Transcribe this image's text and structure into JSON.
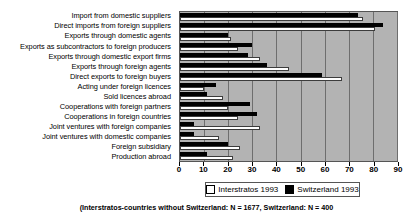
{
  "chart_data": {
    "type": "bar",
    "orientation": "horizontal",
    "title": "",
    "subtitle": "",
    "xlabel": "",
    "ylabel": "",
    "xlim": [
      0,
      90
    ],
    "xticks": [
      0,
      10,
      20,
      30,
      40,
      50,
      60,
      70,
      80,
      90
    ],
    "xtick_labels": [
      "0",
      "10",
      "20",
      "30",
      "40",
      "50",
      "60",
      "70",
      "80",
      "90"
    ],
    "grid": true,
    "grid_axis": "x",
    "legend_position": "bottom",
    "plot_background": "#b3b3b3",
    "categories": [
      "Import from domestic suppliers",
      "Direct imports from foreign suppliers",
      "Exports through domestic agents",
      "Exports as subcontractors to foreign producers",
      "Exports through domestic export firms",
      "Exports through foreign agents",
      "Direct exports to foreign buyers",
      "Acting under foreign licences",
      "Sold licences abroad",
      "Cooperations with foreign partners",
      "Cooperations in foreign countries",
      "Joint ventures with foreign companies",
      "Joint ventures with domestic companies",
      "Foreign subsidiary",
      "Production abroad"
    ],
    "series": [
      {
        "name": "Interstratos 1993",
        "color": "#ffffff",
        "values": [
          76,
          81,
          21,
          24,
          33,
          45,
          67,
          10,
          18,
          20,
          24,
          33,
          16,
          25,
          22
        ]
      },
      {
        "name": "Switzerland 1993",
        "color": "#000000",
        "values": [
          74,
          84,
          20,
          30,
          28,
          36,
          59,
          15,
          11,
          29,
          32,
          6,
          6,
          20,
          11
        ]
      }
    ],
    "footnote": "(Interstratos-countries without Switzerland: N = 1677, Switzerland: N = 400"
  },
  "legend": {
    "entries": [
      {
        "label": "Interstratos 1993",
        "swatch": "white-square-icon"
      },
      {
        "label": "Switzerland 1993",
        "swatch": "black-square-icon"
      }
    ]
  }
}
